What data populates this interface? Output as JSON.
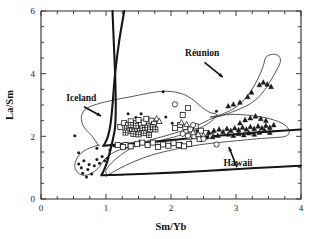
{
  "chart_data": {
    "type": "scatter",
    "title": "",
    "xlabel": "Sm/Yb",
    "ylabel": "La/Sm",
    "xlim": [
      0,
      4
    ],
    "ylim": [
      0,
      6
    ],
    "grid": false,
    "legend_position": "none",
    "x_ticks_major": [
      0,
      1,
      2,
      3,
      4
    ],
    "x_tick_labels": [
      "0",
      "1",
      "2",
      "3",
      "4"
    ],
    "x_minor_step": 0.25,
    "y_ticks_major": [
      0,
      2,
      4,
      6
    ],
    "y_tick_labels": [
      "0",
      "2",
      "4",
      "6"
    ],
    "y_minor_step": 0.5,
    "annotations": [
      {
        "text": "Iceland",
        "x": 0.62,
        "y": 3.12,
        "arrow_to_x": 0.95,
        "arrow_to_y": 2.62
      },
      {
        "text": "Réunion",
        "x": 2.48,
        "y": 4.55,
        "arrow_to_x": 2.82,
        "arrow_to_y": 3.85
      },
      {
        "text": "Hawaii",
        "x": 3.03,
        "y": 1.05,
        "arrow_to_x": 2.88,
        "arrow_to_y": 1.72
      }
    ],
    "fields": [
      {
        "name": "Iceland",
        "style": "thin-outline",
        "outline": [
          [
            0.88,
            1.72
          ],
          [
            0.78,
            2.02
          ],
          [
            0.66,
            2.3
          ],
          [
            0.62,
            2.6
          ],
          [
            0.68,
            2.86
          ],
          [
            0.85,
            3.02
          ],
          [
            1.1,
            3.15
          ],
          [
            1.42,
            3.28
          ],
          [
            1.72,
            3.4
          ],
          [
            1.95,
            3.44
          ],
          [
            2.18,
            3.35
          ],
          [
            2.35,
            3.15
          ],
          [
            2.48,
            2.92
          ],
          [
            2.6,
            2.76
          ],
          [
            2.7,
            2.7
          ],
          [
            2.62,
            2.48
          ],
          [
            2.4,
            2.22
          ],
          [
            2.05,
            1.98
          ],
          [
            1.7,
            1.8
          ],
          [
            1.4,
            1.66
          ],
          [
            1.15,
            1.52
          ],
          [
            0.98,
            1.26
          ],
          [
            0.88,
            0.98
          ],
          [
            0.76,
            0.8
          ],
          [
            0.64,
            0.76
          ],
          [
            0.55,
            0.88
          ],
          [
            0.52,
            1.1
          ],
          [
            0.58,
            1.38
          ],
          [
            0.7,
            1.58
          ],
          [
            0.88,
            1.72
          ]
        ]
      },
      {
        "name": "Hawaii",
        "style": "thin-outline",
        "outline": [
          [
            1.02,
            0.76
          ],
          [
            1.35,
            1.12
          ],
          [
            1.7,
            1.4
          ],
          [
            2.05,
            1.58
          ],
          [
            2.4,
            1.72
          ],
          [
            2.72,
            1.8
          ],
          [
            3.02,
            1.86
          ],
          [
            3.32,
            1.92
          ],
          [
            3.58,
            1.96
          ],
          [
            3.76,
            2.0
          ],
          [
            3.82,
            2.16
          ],
          [
            3.74,
            2.38
          ],
          [
            3.52,
            2.56
          ],
          [
            3.25,
            2.66
          ],
          [
            2.98,
            2.7
          ],
          [
            2.76,
            2.66
          ],
          [
            2.58,
            2.52
          ],
          [
            2.4,
            2.34
          ],
          [
            2.18,
            2.18
          ],
          [
            1.92,
            2.02
          ],
          [
            1.62,
            1.84
          ],
          [
            1.34,
            1.56
          ],
          [
            1.12,
            1.22
          ],
          [
            1.0,
            0.92
          ],
          [
            1.02,
            0.76
          ]
        ]
      },
      {
        "name": "Réunion",
        "style": "thin-outline",
        "outline": [
          [
            2.62,
            2.62
          ],
          [
            2.8,
            2.72
          ],
          [
            2.98,
            2.9
          ],
          [
            3.12,
            3.16
          ],
          [
            3.24,
            3.48
          ],
          [
            3.34,
            3.85
          ],
          [
            3.42,
            4.25
          ],
          [
            3.46,
            4.52
          ],
          [
            3.56,
            4.62
          ],
          [
            3.66,
            4.56
          ],
          [
            3.68,
            4.36
          ],
          [
            3.6,
            4.02
          ],
          [
            3.5,
            3.66
          ],
          [
            3.38,
            3.32
          ],
          [
            3.22,
            3.04
          ],
          [
            3.02,
            2.84
          ],
          [
            2.84,
            2.7
          ],
          [
            2.7,
            2.62
          ],
          [
            2.62,
            2.62
          ]
        ]
      }
    ],
    "model_curves": [
      {
        "name": "garnet-melting-curve-left",
        "points": [
          [
            1.28,
            6.0
          ],
          [
            1.2,
            5.0
          ],
          [
            1.14,
            4.0
          ],
          [
            1.1,
            3.0
          ],
          [
            1.07,
            2.4
          ],
          [
            1.03,
            2.0
          ],
          [
            0.98,
            1.76
          ],
          [
            0.96,
            1.7
          ]
        ]
      },
      {
        "name": "spinel-melting-curve-steep",
        "points": [
          [
            1.1,
            6.0
          ],
          [
            1.12,
            5.0
          ],
          [
            1.14,
            4.0
          ],
          [
            1.15,
            3.0
          ],
          [
            1.14,
            2.3
          ],
          [
            1.1,
            1.85
          ],
          [
            1.02,
            1.2
          ],
          [
            0.96,
            0.88
          ],
          [
            0.93,
            0.76
          ]
        ]
      },
      {
        "name": "mixing-line-upper",
        "points": [
          [
            0.96,
            1.7
          ],
          [
            1.3,
            1.76
          ],
          [
            1.7,
            1.82
          ],
          [
            2.1,
            1.9
          ],
          [
            2.5,
            1.98
          ],
          [
            2.9,
            2.05
          ],
          [
            3.3,
            2.12
          ],
          [
            3.7,
            2.18
          ],
          [
            4.0,
            2.22
          ]
        ]
      },
      {
        "name": "mixing-line-lower",
        "points": [
          [
            0.93,
            0.76
          ],
          [
            1.3,
            0.78
          ],
          [
            1.8,
            0.82
          ],
          [
            2.3,
            0.87
          ],
          [
            2.8,
            0.93
          ],
          [
            3.3,
            0.99
          ],
          [
            3.7,
            1.03
          ],
          [
            4.0,
            1.06
          ]
        ]
      }
    ],
    "series": [
      {
        "name": "filled-dots",
        "marker": "filled-circle",
        "points": [
          [
            0.52,
            2.02
          ],
          [
            0.58,
            1.12
          ],
          [
            0.62,
            1.0
          ],
          [
            0.66,
            1.22
          ],
          [
            0.64,
            0.82
          ],
          [
            0.72,
            0.94
          ],
          [
            0.74,
            1.1
          ],
          [
            0.7,
            0.7
          ],
          [
            0.78,
            0.8
          ],
          [
            0.82,
            1.06
          ],
          [
            0.86,
            1.26
          ],
          [
            0.9,
            1.14
          ],
          [
            0.94,
            1.36
          ],
          [
            0.98,
            1.22
          ],
          [
            1.02,
            1.3
          ],
          [
            0.58,
            1.48
          ],
          [
            0.86,
            1.62
          ],
          [
            1.06,
            1.56
          ],
          [
            1.12,
            1.7
          ],
          [
            1.34,
            2.72
          ],
          [
            1.46,
            2.6
          ],
          [
            1.54,
            2.72
          ],
          [
            1.6,
            2.46
          ],
          [
            1.66,
            2.55
          ],
          [
            1.88,
            3.42
          ],
          [
            1.92,
            2.62
          ],
          [
            2.02,
            2.42
          ],
          [
            2.12,
            2.32
          ],
          [
            2.22,
            2.3
          ],
          [
            2.32,
            2.22
          ],
          [
            2.4,
            2.16
          ],
          [
            2.52,
            2.12
          ],
          [
            2.62,
            2.08
          ],
          [
            2.7,
            2.8
          ],
          [
            2.56,
            1.95
          ],
          [
            2.46,
            1.86
          ],
          [
            2.3,
            1.82
          ],
          [
            2.16,
            1.78
          ],
          [
            1.98,
            1.74
          ],
          [
            1.8,
            1.72
          ],
          [
            1.52,
            1.84
          ],
          [
            1.3,
            1.76
          ],
          [
            1.16,
            1.7
          ]
        ]
      },
      {
        "name": "open-squares",
        "marker": "open-square",
        "points": [
          [
            1.22,
            2.3
          ],
          [
            1.28,
            2.42
          ],
          [
            1.34,
            2.36
          ],
          [
            1.38,
            2.48
          ],
          [
            1.42,
            2.3
          ],
          [
            1.46,
            2.42
          ],
          [
            1.5,
            2.52
          ],
          [
            1.54,
            2.36
          ],
          [
            1.58,
            2.44
          ],
          [
            1.62,
            2.56
          ],
          [
            1.66,
            2.34
          ],
          [
            1.7,
            2.5
          ],
          [
            1.74,
            2.4
          ],
          [
            1.3,
            1.72
          ],
          [
            1.38,
            1.68
          ],
          [
            1.48,
            1.76
          ],
          [
            1.56,
            1.8
          ],
          [
            1.64,
            1.72
          ],
          [
            1.72,
            1.8
          ],
          [
            1.8,
            1.66
          ],
          [
            1.88,
            1.74
          ],
          [
            1.96,
            1.7
          ],
          [
            2.04,
            1.78
          ],
          [
            2.12,
            1.72
          ],
          [
            2.2,
            1.68
          ],
          [
            2.28,
            1.76
          ],
          [
            2.06,
            2.26
          ],
          [
            2.14,
            2.36
          ],
          [
            2.22,
            2.3
          ],
          [
            2.3,
            2.22
          ],
          [
            2.38,
            2.32
          ],
          [
            2.26,
            2.9
          ],
          [
            2.18,
            2.68
          ],
          [
            1.26,
            1.66
          ],
          [
            1.18,
            1.72
          ],
          [
            2.46,
            2.18
          ],
          [
            2.54,
            2.1
          ],
          [
            2.62,
            2.02
          ],
          [
            2.36,
            2.0
          ],
          [
            2.44,
            1.92
          ]
        ]
      },
      {
        "name": "crossed-squares",
        "marker": "crossed-square",
        "points": [
          [
            1.32,
            2.26
          ],
          [
            1.36,
            2.18
          ],
          [
            1.4,
            2.24
          ],
          [
            1.44,
            2.16
          ],
          [
            1.48,
            2.24
          ],
          [
            1.52,
            2.18
          ],
          [
            1.56,
            2.26
          ],
          [
            1.6,
            2.2
          ],
          [
            1.64,
            2.28
          ],
          [
            1.68,
            2.22
          ],
          [
            1.42,
            2.08
          ],
          [
            1.5,
            2.06
          ],
          [
            1.58,
            2.1
          ],
          [
            1.66,
            2.04
          ],
          [
            1.3,
            2.12
          ],
          [
            1.38,
            2.36
          ],
          [
            1.46,
            2.34
          ],
          [
            1.72,
            2.3
          ],
          [
            1.76,
            2.22
          ]
        ]
      },
      {
        "name": "open-triangles",
        "marker": "open-triangle",
        "points": [
          [
            1.78,
            2.56
          ],
          [
            1.82,
            2.48
          ],
          [
            2.16,
            2.44
          ],
          [
            2.24,
            2.38
          ],
          [
            2.34,
            2.12
          ],
          [
            2.42,
            2.06
          ],
          [
            2.5,
            2.02
          ],
          [
            2.28,
            1.98
          ]
        ]
      },
      {
        "name": "filled-triangles",
        "marker": "filled-triangle",
        "points": [
          [
            2.58,
            2.12
          ],
          [
            2.66,
            2.18
          ],
          [
            2.74,
            2.22
          ],
          [
            2.8,
            2.14
          ],
          [
            2.86,
            2.24
          ],
          [
            2.92,
            2.18
          ],
          [
            2.98,
            2.26
          ],
          [
            3.04,
            2.2
          ],
          [
            3.1,
            2.28
          ],
          [
            3.16,
            2.22
          ],
          [
            3.22,
            2.3
          ],
          [
            3.28,
            2.24
          ],
          [
            3.34,
            2.32
          ],
          [
            3.4,
            2.26
          ],
          [
            3.46,
            2.34
          ],
          [
            3.52,
            2.28
          ],
          [
            3.58,
            2.36
          ],
          [
            3.06,
            2.42
          ],
          [
            3.14,
            2.52
          ],
          [
            3.22,
            2.58
          ],
          [
            3.3,
            2.64
          ],
          [
            3.38,
            2.56
          ],
          [
            3.46,
            2.5
          ],
          [
            2.88,
            2.06
          ],
          [
            2.96,
            2.02
          ],
          [
            3.04,
            2.08
          ],
          [
            3.12,
            2.04
          ],
          [
            3.2,
            2.1
          ],
          [
            3.28,
            2.06
          ],
          [
            3.36,
            2.12
          ],
          [
            2.72,
            2.02
          ],
          [
            2.64,
            1.98
          ],
          [
            3.44,
            2.18
          ],
          [
            3.52,
            2.12
          ]
        ]
      },
      {
        "name": "reunion-filled-triangles",
        "marker": "filled-triangle",
        "points": [
          [
            2.88,
            2.96
          ],
          [
            2.96,
            3.02
          ],
          [
            3.06,
            3.08
          ],
          [
            3.18,
            3.26
          ],
          [
            3.24,
            3.4
          ],
          [
            3.36,
            3.64
          ],
          [
            3.42,
            3.72
          ],
          [
            3.48,
            3.66
          ],
          [
            3.54,
            3.58
          ]
        ]
      },
      {
        "name": "open-circles",
        "marker": "open-circle",
        "points": [
          [
            2.06,
            3.02
          ],
          [
            2.34,
            2.36
          ],
          [
            2.5,
            1.92
          ],
          [
            2.7,
            1.74
          ],
          [
            2.18,
            2.08
          ],
          [
            2.26,
            2.02
          ]
        ]
      }
    ]
  }
}
